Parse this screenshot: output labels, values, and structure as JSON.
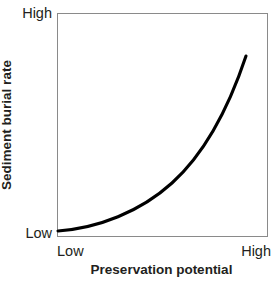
{
  "chart_data": {
    "type": "line",
    "title": "",
    "subtitle": "",
    "xlabel": "Preservation potential",
    "ylabel": "Sediment burial rate",
    "x_tick_labels": [
      "Low",
      "High"
    ],
    "y_tick_labels": [
      "Low",
      "High"
    ],
    "xlim": [
      0,
      1
    ],
    "ylim": [
      0,
      1
    ],
    "grid": false,
    "legend": null,
    "annotations": [],
    "series": [
      {
        "name": "Sediment burial rate vs preservation potential",
        "relationship": "monotonic increasing, exponential / convex upward",
        "color": "#000000",
        "line_width": 3,
        "x": [
          0.0,
          0.1,
          0.2,
          0.3,
          0.4,
          0.5,
          0.6,
          0.7,
          0.8,
          0.9,
          1.0
        ],
        "y": [
          0.0,
          0.03,
          0.07,
          0.12,
          0.18,
          0.26,
          0.36,
          0.49,
          0.64,
          0.81,
          1.0
        ]
      }
    ],
    "curve_path_px": "M 58 231 C 98 228, 140 212, 172 183 C 203 155, 228 110, 246 56",
    "frame": {
      "left": 57,
      "top": 13,
      "right": 268,
      "bottom": 237,
      "color": "#8a8a8a"
    }
  },
  "axes": {
    "y": {
      "title": "Sediment burial rate",
      "high_label": "High",
      "low_label": "Low"
    },
    "x": {
      "title": "Preservation potential",
      "high_label": "High",
      "low_label": "Low"
    }
  },
  "colors": {
    "curve": "#000000",
    "frame": "#8a8a8a",
    "text": "#231f20",
    "background": "#ffffff"
  }
}
